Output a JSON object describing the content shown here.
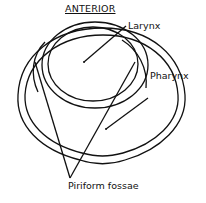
{
  "diagram": {
    "title": "ANTERIOR",
    "labels": {
      "larynx": "Larynx",
      "pharynx": "Pharynx",
      "piriform": "Piriform fossae"
    }
  }
}
